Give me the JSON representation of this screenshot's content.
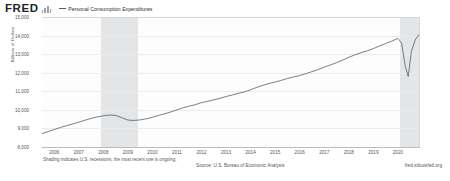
{
  "brand": {
    "logo_text": "FRED",
    "logo_icon": "bar-chart-icon"
  },
  "legend": [
    {
      "label": "Personal Consumption Expenditures",
      "color": "#4f5f73"
    }
  ],
  "footer": {
    "recession_note": "Shading indicates U.S. recessions; the most recent one is ongoing.",
    "source": "Source: U.S. Bureau of Economic Analysis",
    "site": "fred.stlouisfed.org"
  },
  "chart_data": {
    "type": "line",
    "title": "Personal Consumption Expenditures",
    "xlabel": "",
    "ylabel": "Billions of Dollars",
    "ylim": [
      8000,
      15000
    ],
    "xlim": [
      2005.5,
      2020.9
    ],
    "grid": true,
    "legend_position": "top",
    "yticks": [
      8000,
      9000,
      10000,
      11000,
      12000,
      13000,
      14000,
      15000
    ],
    "ytick_labels": [
      "8,000",
      "9,000",
      "10,000",
      "11,000",
      "12,000",
      "13,000",
      "14,000",
      "15,000"
    ],
    "xticks": [
      2006,
      2007,
      2008,
      2009,
      2010,
      2011,
      2012,
      2013,
      2014,
      2015,
      2016,
      2017,
      2018,
      2019,
      2020
    ],
    "xtick_labels": [
      "2006",
      "2007",
      "2008",
      "2009",
      "2010",
      "2011",
      "2012",
      "2013",
      "2014",
      "2015",
      "2016",
      "2017",
      "2018",
      "2019",
      "2020"
    ],
    "recessions": [
      {
        "start": 2007.92,
        "end": 2009.42
      },
      {
        "start": 2020.08,
        "end": 2020.9
      }
    ],
    "series": [
      {
        "name": "Personal Consumption Expenditures",
        "color": "#4f5f73",
        "x": [
          2005.5,
          2005.75,
          2006.0,
          2006.25,
          2006.5,
          2006.75,
          2007.0,
          2007.25,
          2007.5,
          2007.75,
          2008.0,
          2008.25,
          2008.5,
          2008.75,
          2009.0,
          2009.25,
          2009.5,
          2009.75,
          2010.0,
          2010.25,
          2010.5,
          2010.75,
          2011.0,
          2011.25,
          2011.5,
          2011.75,
          2012.0,
          2012.25,
          2012.5,
          2012.75,
          2013.0,
          2013.25,
          2013.5,
          2013.75,
          2014.0,
          2014.25,
          2014.5,
          2014.75,
          2015.0,
          2015.25,
          2015.5,
          2015.75,
          2016.0,
          2016.25,
          2016.5,
          2016.75,
          2017.0,
          2017.25,
          2017.5,
          2017.75,
          2018.0,
          2018.25,
          2018.5,
          2018.75,
          2019.0,
          2019.25,
          2019.5,
          2019.75,
          2020.0,
          2020.15,
          2020.3,
          2020.42,
          2020.55,
          2020.7,
          2020.85
        ],
        "y": [
          8720,
          8830,
          8940,
          9050,
          9150,
          9240,
          9340,
          9440,
          9540,
          9620,
          9680,
          9720,
          9700,
          9580,
          9450,
          9430,
          9460,
          9520,
          9600,
          9700,
          9790,
          9890,
          10000,
          10110,
          10200,
          10280,
          10390,
          10460,
          10540,
          10620,
          10720,
          10800,
          10890,
          10970,
          11080,
          11210,
          11320,
          11420,
          11500,
          11590,
          11690,
          11770,
          11850,
          11950,
          12060,
          12170,
          12300,
          12420,
          12540,
          12680,
          12830,
          12960,
          13080,
          13180,
          13300,
          13440,
          13570,
          13700,
          13850,
          13600,
          12350,
          11800,
          13150,
          13750,
          14050
        ]
      }
    ],
    "final_value_note": "COVID-19 collapse and rebound in 2020"
  }
}
